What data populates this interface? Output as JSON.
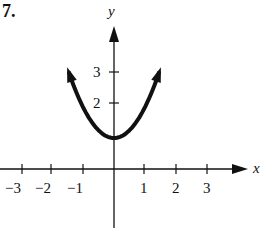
{
  "problem_number": "7.",
  "chart_data": {
    "type": "line",
    "title": "",
    "xlabel": "x",
    "ylabel": "y",
    "x_ticks": [
      -3,
      -2,
      -1,
      1,
      2,
      3
    ],
    "x_tick_labels": [
      "−3",
      "−2",
      "−1",
      "1",
      "2",
      "3"
    ],
    "y_ticks": [
      2,
      3
    ],
    "y_tick_labels": [
      "2",
      "3"
    ],
    "xlim": [
      -3.7,
      3.8
    ],
    "ylim": [
      -2,
      4.2
    ],
    "grid": false,
    "series": [
      {
        "name": "curve",
        "description": "U-shaped curve with vertex at (0,1), arrows at both ends",
        "x": [
          -1.45,
          -1,
          -0.5,
          0,
          0.5,
          1,
          1.45
        ],
        "y": [
          3.1,
          2.0,
          1.25,
          1.0,
          1.25,
          2.0,
          3.1
        ]
      }
    ]
  }
}
